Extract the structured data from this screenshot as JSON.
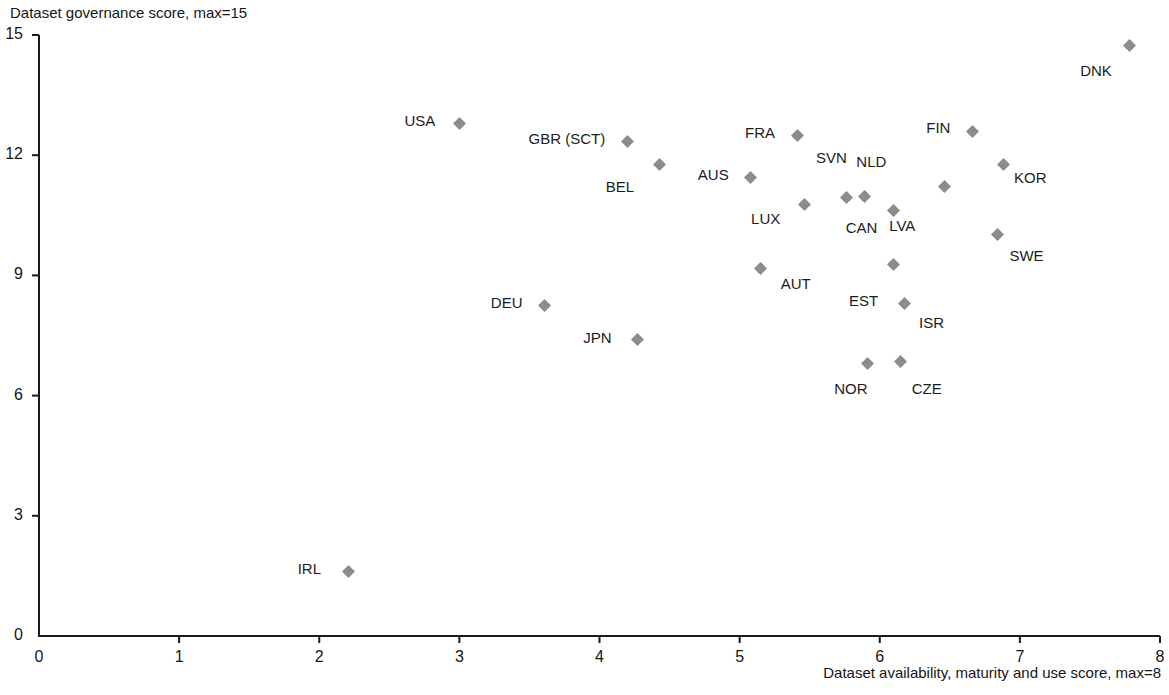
{
  "chart_data": {
    "type": "scatter",
    "title": "",
    "xlabel": "Dataset availability, maturity and use score, max=8",
    "ylabel": "Dataset governance score, max=15",
    "xlim": [
      0,
      8
    ],
    "ylim": [
      0,
      15
    ],
    "xticks": [
      "0",
      "1",
      "2",
      "3",
      "4",
      "5",
      "6",
      "7",
      "8"
    ],
    "yticks": [
      "0",
      "3",
      "6",
      "9",
      "12",
      "15"
    ],
    "grid": false,
    "legend": "none",
    "marker_color": "#8c8c8c",
    "axis_color": "#1a1a1a",
    "points": [
      {
        "label": "DNK",
        "x": 7.78,
        "y": 14.75,
        "lx": -52,
        "ly": 26
      },
      {
        "label": "USA",
        "x": 3.0,
        "y": 12.78,
        "lx": -58,
        "ly": -3
      },
      {
        "label": "FRA",
        "x": 5.41,
        "y": 12.48,
        "lx": -55,
        "ly": -3
      },
      {
        "label": "FIN",
        "x": 6.66,
        "y": 12.6,
        "lx": -49,
        "ly": -3
      },
      {
        "label": "GBR (SCT)",
        "x": 4.2,
        "y": 12.35,
        "lx": -102,
        "ly": -2
      },
      {
        "label": "BEL",
        "x": 4.43,
        "y": 11.77,
        "lx": -57,
        "ly": 23
      },
      {
        "label": "AUS",
        "x": 5.08,
        "y": 11.44,
        "lx": -56,
        "ly": -3
      },
      {
        "label": "SVN",
        "x": 5.76,
        "y": 10.95,
        "lx": -33,
        "ly": -39
      },
      {
        "label": "NLD",
        "x": 5.89,
        "y": 10.98,
        "lx": -11,
        "ly": -34
      },
      {
        "label": "KOR",
        "x": 6.88,
        "y": 11.78,
        "lx": 8,
        "ly": 14
      },
      {
        "label": "LVA",
        "x": 6.46,
        "y": 11.23,
        "lx": -58,
        "ly": 40
      },
      {
        "label": "LUX",
        "x": 5.46,
        "y": 10.76,
        "lx": -56,
        "ly": 14
      },
      {
        "label": "CAN",
        "x": 6.1,
        "y": 10.62,
        "lx": -51,
        "ly": 18
      },
      {
        "label": "SWE",
        "x": 6.84,
        "y": 10.03,
        "lx": 9,
        "ly": 22
      },
      {
        "label": "AUT",
        "x": 5.15,
        "y": 9.18,
        "lx": 17,
        "ly": 16
      },
      {
        "label": "CAN2",
        "x": 6.1,
        "y": 9.28,
        "lx": 0,
        "ly": 0,
        "hide_label": true
      },
      {
        "label": "DEU",
        "x": 3.61,
        "y": 8.26,
        "lx": -57,
        "ly": -2
      },
      {
        "label": "EST",
        "x": 6.18,
        "y": 8.31,
        "lx": -59,
        "ly": -2
      },
      {
        "label": "ISR",
        "x": 6.18,
        "y": 8.31,
        "lx": 11,
        "ly": 20,
        "hide_marker": true
      },
      {
        "label": "JPN",
        "x": 4.27,
        "y": 7.39,
        "lx": -57,
        "ly": -2
      },
      {
        "label": "NOR",
        "x": 5.91,
        "y": 6.81,
        "lx": -36,
        "ly": 26
      },
      {
        "label": "CZE",
        "x": 6.15,
        "y": 6.84,
        "lx": 8,
        "ly": 27
      },
      {
        "label": "IRL",
        "x": 2.21,
        "y": 1.62,
        "lx": -54,
        "ly": -2
      }
    ]
  },
  "axis": {
    "y_title": "Dataset governance score, max=15",
    "x_title": "Dataset availability, maturity and use score, max=8"
  }
}
